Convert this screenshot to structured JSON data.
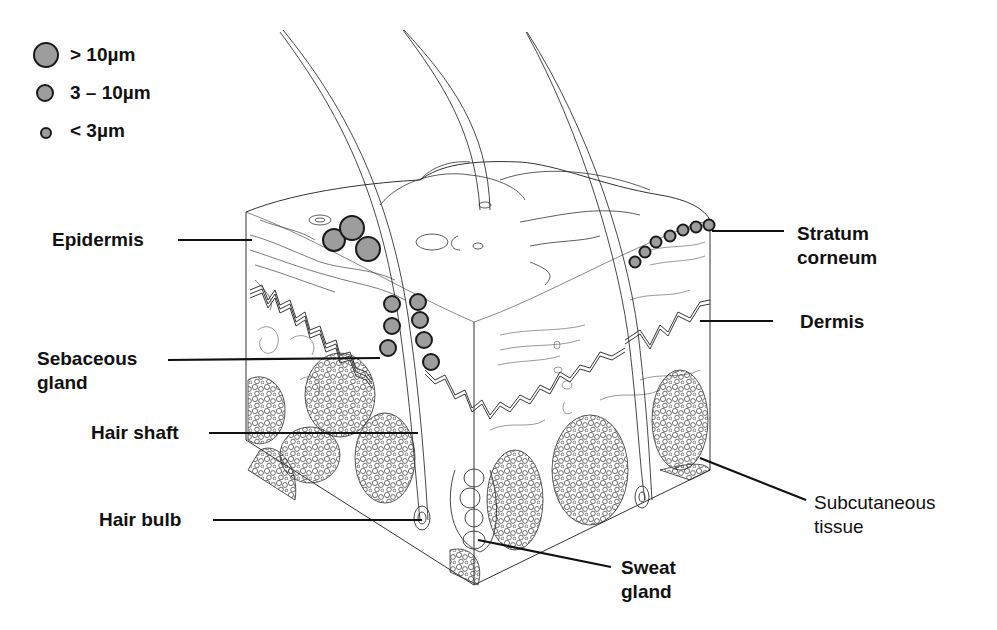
{
  "diagram": {
    "colors": {
      "particle_fill": "#9d9d9d",
      "line": "#111111",
      "background": "#ffffff"
    },
    "legend": {
      "items": [
        {
          "size": "large",
          "label": "> 10µm"
        },
        {
          "size": "medium",
          "label": "3 – 10µm"
        },
        {
          "size": "small",
          "label": "< 3µm"
        }
      ]
    },
    "labels": {
      "epidermis": "Epidermis",
      "sebaceous_gland": "Sebaceous\ngland",
      "hair_shaft": "Hair shaft",
      "hair_bulb": "Hair bulb",
      "stratum_corneum": "Stratum\ncorneum",
      "dermis": "Dermis",
      "subcutaneous_tissue": "Subcutaneous\ntissue",
      "sweat_gland": "Sweat\ngland"
    }
  }
}
